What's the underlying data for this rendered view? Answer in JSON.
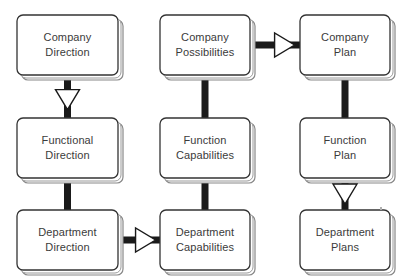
{
  "diagram": {
    "type": "flow-matrix",
    "background_color": "#ffffff",
    "box_fill_color": "#ffffff",
    "box_stroke_color": "#333333",
    "bevel_color": "#888888",
    "connector_color": "#1a1a1a",
    "arrowhead_fill": "#ffffff",
    "text_color": "#3b3b3b",
    "columns": [
      "Direction",
      "Capabilities",
      "Plan"
    ],
    "rows": [
      "Company",
      "Function",
      "Department"
    ],
    "nodes": [
      {
        "id": "company-direction",
        "line1": "Company",
        "line2": "Direction",
        "col": 0,
        "row": 0,
        "x": 17,
        "y": 15,
        "w": 101,
        "h": 60
      },
      {
        "id": "company-possibilities",
        "line1": "Company",
        "line2": "Possibilities",
        "col": 1,
        "row": 0,
        "x": 160,
        "y": 15,
        "w": 90,
        "h": 60
      },
      {
        "id": "company-plan",
        "line1": "Company",
        "line2": "Plan",
        "col": 2,
        "row": 0,
        "x": 300,
        "y": 15,
        "w": 90,
        "h": 60
      },
      {
        "id": "functional-direction",
        "line1": "Functional",
        "line2": "Direction",
        "col": 0,
        "row": 1,
        "x": 17,
        "y": 118,
        "w": 101,
        "h": 60
      },
      {
        "id": "function-capabilities",
        "line1": "Function",
        "line2": "Capabilities",
        "col": 1,
        "row": 1,
        "x": 160,
        "y": 118,
        "w": 90,
        "h": 60
      },
      {
        "id": "function-plan",
        "line1": "Function",
        "line2": "Plan",
        "col": 2,
        "row": 1,
        "x": 300,
        "y": 118,
        "w": 90,
        "h": 60
      },
      {
        "id": "department-direction",
        "line1": "Department",
        "line2": "Direction",
        "col": 0,
        "row": 2,
        "x": 17,
        "y": 210,
        "w": 101,
        "h": 60
      },
      {
        "id": "department-capabilities",
        "line1": "Department",
        "line2": "Capabilities",
        "col": 1,
        "row": 2,
        "x": 160,
        "y": 210,
        "w": 90,
        "h": 60
      },
      {
        "id": "department-plans",
        "line1": "Department",
        "line2": "Plans",
        "col": 2,
        "row": 2,
        "x": 300,
        "y": 210,
        "w": 90,
        "h": 60
      }
    ],
    "connectors": [
      {
        "id": "conn-company-direction-to-functional-direction",
        "from": "company-direction",
        "to": "functional-direction",
        "orientation": "vertical",
        "arrowhead": true
      },
      {
        "id": "conn-functional-direction-to-department-direction",
        "from": "functional-direction",
        "to": "department-direction",
        "orientation": "vertical",
        "arrowhead": false
      },
      {
        "id": "conn-company-possibilities-to-function-capabilities",
        "from": "company-possibilities",
        "to": "function-capabilities",
        "orientation": "vertical",
        "arrowhead": false
      },
      {
        "id": "conn-function-capabilities-to-department-capabilities",
        "from": "function-capabilities",
        "to": "department-capabilities",
        "orientation": "vertical",
        "arrowhead": false
      },
      {
        "id": "conn-company-plan-to-function-plan",
        "from": "company-plan",
        "to": "function-plan",
        "orientation": "vertical",
        "arrowhead": false
      },
      {
        "id": "conn-function-plan-to-department-plans",
        "from": "function-plan",
        "to": "department-plans",
        "orientation": "vertical",
        "arrowhead": true
      },
      {
        "id": "conn-company-possibilities-to-company-plan",
        "from": "company-possibilities",
        "to": "company-plan",
        "orientation": "horizontal",
        "arrowhead": true
      },
      {
        "id": "conn-department-direction-to-department-capabilities",
        "from": "department-direction",
        "to": "department-capabilities",
        "orientation": "horizontal",
        "arrowhead": true
      }
    ],
    "artifacts": [
      {
        "id": "scan-speck",
        "x": 380,
        "y": 207,
        "w": 2,
        "h": 3
      }
    ]
  }
}
